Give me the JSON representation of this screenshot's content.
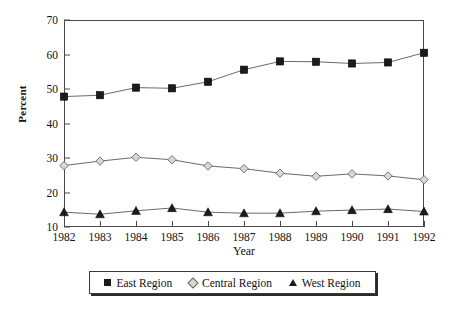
{
  "chart_data": {
    "type": "line",
    "title": "",
    "subtitle": "",
    "xlabel": "Year",
    "ylabel": "Percent",
    "categories": [
      "1982",
      "1983",
      "1984",
      "1985",
      "1986",
      "1987",
      "1988",
      "1989",
      "1990",
      "1991",
      "1992"
    ],
    "x": [
      1982,
      1983,
      1984,
      1985,
      1986,
      1987,
      1988,
      1989,
      1990,
      1991,
      1992
    ],
    "ylim": [
      10,
      70
    ],
    "xlim": [
      1982,
      1992
    ],
    "yticks": [
      10,
      20,
      30,
      40,
      50,
      60,
      70
    ],
    "ytick_labels": [
      "10",
      "20",
      "30",
      "40",
      "50",
      "60",
      "70"
    ],
    "xtick_labels": [
      "1982",
      "1983",
      "1984",
      "1985",
      "1986",
      "1987",
      "1988",
      "1989",
      "1990",
      "1991",
      "1992"
    ],
    "grid": false,
    "legend_position": "bottom",
    "series": [
      {
        "name": "East Region",
        "marker": "filled-square",
        "marker_color": "#1b1b1b",
        "line_color": "#5a5a5a",
        "values": [
          47.8,
          48.2,
          50.4,
          50.2,
          52.1,
          55.6,
          58.0,
          57.9,
          57.4,
          57.7,
          60.5
        ]
      },
      {
        "name": "Central Region",
        "marker": "open-diamond",
        "marker_color": "#d8d8d8",
        "line_color": "#5a5a5a",
        "values": [
          27.8,
          29.1,
          30.2,
          29.5,
          27.7,
          26.9,
          25.6,
          24.7,
          25.4,
          24.8,
          23.7
        ]
      },
      {
        "name": "West Region",
        "marker": "filled-triangle",
        "marker_color": "#1b1b1b",
        "line_color": "#5a5a5a",
        "values": [
          14.3,
          13.7,
          14.7,
          15.5,
          14.3,
          14.0,
          14.0,
          14.6,
          14.9,
          15.2,
          14.5
        ]
      }
    ]
  },
  "legend": {
    "entries": [
      {
        "label": "East Region",
        "marker": "filled-square-marker"
      },
      {
        "label": "Central Region",
        "marker": "open-diamond-marker"
      },
      {
        "label": "West Region",
        "marker": "filled-triangle-marker"
      }
    ]
  },
  "colors": {
    "axis": "#4a4a4a",
    "line": "#5a5a5a",
    "dark_marker": "#1b1b1b",
    "light_marker": "#d8d8d8",
    "text": "#111111",
    "background": "#ffffff"
  }
}
